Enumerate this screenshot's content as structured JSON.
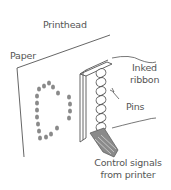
{
  "labels": {
    "printhead": "Printhead",
    "paper": "Paper",
    "inked_ribbon_line1": "Inked",
    "inked_ribbon_line2": "ribbon",
    "pins": "Pins",
    "control_line1": "Control signals",
    "control_line2": "from printer"
  },
  "colors": {
    "line": "#555555",
    "dots": "#8a8a8a",
    "text": "#555555",
    "cable": "#777777"
  },
  "dot_matrix_character": "0"
}
